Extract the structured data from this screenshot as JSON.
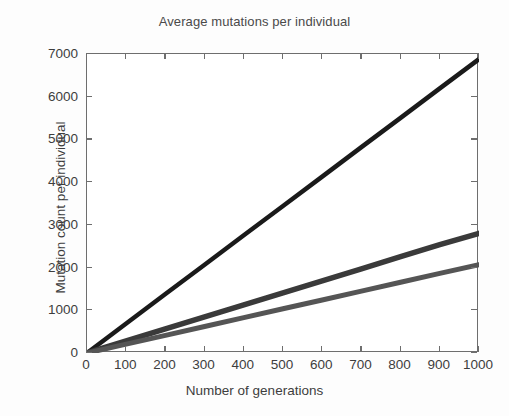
{
  "chart_data": {
    "type": "line",
    "title": "Average mutations per individual",
    "xlabel": "Number of generations",
    "ylabel": "Mutation count per individual",
    "xlim": [
      0,
      1000
    ],
    "ylim": [
      0,
      7000
    ],
    "xticks": [
      0,
      100,
      200,
      300,
      400,
      500,
      600,
      700,
      800,
      900,
      1000
    ],
    "yticks": [
      0,
      1000,
      2000,
      3000,
      4000,
      5000,
      6000,
      7000
    ],
    "xtick_labels": [
      "0",
      "100",
      "200",
      "300",
      "400",
      "500",
      "600",
      "700",
      "800",
      "900",
      "1000"
    ],
    "ytick_labels": [
      "0",
      "1000",
      "2000",
      "3000",
      "4000",
      "5000",
      "6000",
      "7000"
    ],
    "grid": false,
    "legend": null,
    "background": "#ffffff",
    "axis_color": "#6e6e6e",
    "x": [
      0,
      100,
      200,
      300,
      400,
      500,
      600,
      700,
      800,
      900,
      1000
    ],
    "series": [
      {
        "name": "total mutations",
        "color": "#1a1a1a",
        "line_width": 4.5,
        "values": [
          0,
          690,
          1380,
          2065,
          2755,
          3440,
          4130,
          4820,
          5505,
          6195,
          6880
        ]
      },
      {
        "name": "neutral mutations",
        "color": "#3a3a3a",
        "line_width": 5.5,
        "values": [
          0,
          282,
          564,
          846,
          1128,
          1410,
          1690,
          1972,
          2254,
          2536,
          2800
        ]
      },
      {
        "name": "deleterious mutations",
        "color": "#555555",
        "line_width": 5.0,
        "values": [
          0,
          207,
          414,
          621,
          828,
          1035,
          1242,
          1449,
          1656,
          1863,
          2065
        ]
      }
    ]
  }
}
